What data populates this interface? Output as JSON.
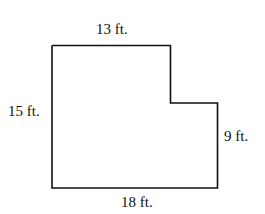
{
  "diagram": {
    "type": "L-shaped floor plan",
    "stroke_color": "#111111",
    "labels": {
      "top": "13 ft.",
      "left": "15 ft.",
      "right": "9 ft.",
      "bottom": "18 ft."
    },
    "dimensions_ft": {
      "top": 13,
      "left": 15,
      "right": 9,
      "bottom": 18
    }
  }
}
